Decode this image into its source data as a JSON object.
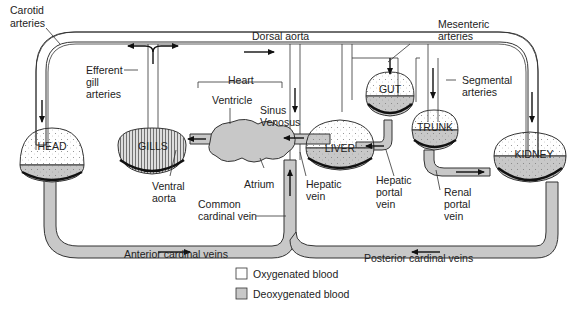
{
  "labels": {
    "carotid": [
      "Carotid",
      "arteries"
    ],
    "dorsal_aorta": "Dorsal aorta",
    "mesenteric": [
      "Mesenteric",
      "arteries"
    ],
    "efferent": [
      "Efferent",
      "gill",
      "arteries"
    ],
    "heart": "Heart",
    "ventricle": "Ventricle",
    "sinus": [
      "Sinus",
      "Venosus"
    ],
    "segmental": [
      "Segmental",
      "arteries"
    ],
    "ventral_aorta": [
      "Ventral",
      "aorta"
    ],
    "atrium": "Atrium",
    "common_cardinal": [
      "Common",
      "cardinal vein"
    ],
    "hepatic_vein": [
      "Hepatic",
      "vein"
    ],
    "hepatic_portal": [
      "Hepatic",
      "portal",
      "vein"
    ],
    "renal_portal": [
      "Renal",
      "portal",
      "vein"
    ],
    "anterior_cardinal": "Anterior cardinal veins",
    "posterior_cardinal": "Posterior cardinal veins"
  },
  "organs": {
    "head": "HEAD",
    "gills": "GILLS",
    "liver": "LIVER",
    "gut": "GUT",
    "trunk": "TRUNK",
    "kidney": "KIDNEY"
  },
  "legend": [
    {
      "label": "Oxygenated blood",
      "color": "#ffffff"
    },
    {
      "label": "Deoxygenated blood",
      "color": "#c8c8c8"
    }
  ],
  "colors": {
    "deoxygenated": "#c8c8c8",
    "oxygenated": "#ffffff",
    "outline": "#333333"
  }
}
